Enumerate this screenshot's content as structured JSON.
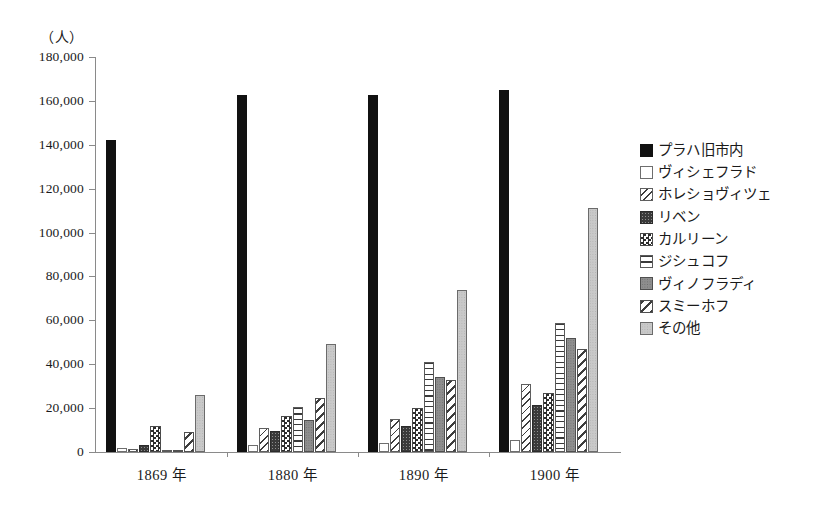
{
  "axis": {
    "unit_label": "（人）",
    "y_ticks": [
      "180,000",
      "160,000",
      "140,000",
      "120,000",
      "100,000",
      "80,000",
      "60,000",
      "40,000",
      "20,000",
      "0"
    ],
    "x_labels": [
      "1869 年",
      "1880 年",
      "1890 年",
      "1900 年"
    ]
  },
  "legend": {
    "items": [
      {
        "label": "プラハ旧市内",
        "pattern": "solid-black"
      },
      {
        "label": "ヴィシェフラド",
        "pattern": "white"
      },
      {
        "label": "ホレショヴィツェ",
        "pattern": "diag-light"
      },
      {
        "label": "リベン",
        "pattern": "dark-dot"
      },
      {
        "label": "カルリーン",
        "pattern": "checker"
      },
      {
        "label": "ジシュコフ",
        "pattern": "hline"
      },
      {
        "label": "ヴィノフラディ",
        "pattern": "midgray"
      },
      {
        "label": "スミーホフ",
        "pattern": "diag-wide"
      },
      {
        "label": "その他",
        "pattern": "lightgray"
      }
    ]
  },
  "chart_data": {
    "type": "bar",
    "title": "",
    "xlabel": "",
    "ylabel": "（人）",
    "ylim": [
      0,
      180000
    ],
    "ytick_step": 20000,
    "grid": false,
    "legend_position": "right",
    "categories": [
      "1869 年",
      "1880 年",
      "1890 年",
      "1900 年"
    ],
    "series": [
      {
        "name": "プラハ旧市内",
        "pattern": "solid-black",
        "values": [
          142000,
          162500,
          162500,
          165000
        ]
      },
      {
        "name": "ヴィシェフラド",
        "pattern": "white",
        "values": [
          2000,
          3000,
          4000,
          5500
        ]
      },
      {
        "name": "ホレショヴィツェ",
        "pattern": "diag-light",
        "values": [
          1500,
          11000,
          15000,
          31000
        ]
      },
      {
        "name": "リベン",
        "pattern": "dark-dot",
        "values": [
          3000,
          9500,
          12000,
          21500
        ]
      },
      {
        "name": "カルリーン",
        "pattern": "checker",
        "values": [
          12000,
          16500,
          20000,
          27000
        ]
      },
      {
        "name": "ジシュコフ",
        "pattern": "hline",
        "values": [
          600,
          20500,
          41000,
          59000
        ]
      },
      {
        "name": "ヴィノフラディ",
        "pattern": "midgray",
        "values": [
          700,
          14500,
          34000,
          52000
        ]
      },
      {
        "name": "スミーホフ",
        "pattern": "diag-wide",
        "values": [
          9000,
          24500,
          33000,
          47000
        ]
      },
      {
        "name": "その他",
        "pattern": "lightgray",
        "values": [
          26000,
          49000,
          74000,
          111000
        ]
      }
    ]
  }
}
